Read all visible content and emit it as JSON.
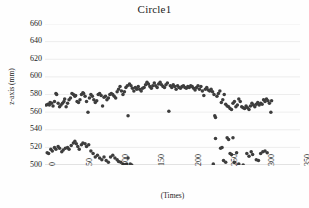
{
  "chart_data": {
    "type": "scatter",
    "title": "Circle1",
    "xlabel": "(Times)",
    "ylabel": "z-axis (mm)",
    "xlim": [
      0,
      350
    ],
    "ylim": [
      500,
      660
    ],
    "xticks": [
      "0",
      "50",
      "100",
      "150",
      "200",
      "250",
      "300",
      "350"
    ],
    "xtick_values": [
      0,
      50,
      100,
      150,
      200,
      250,
      300,
      350
    ],
    "yticks": [
      "500",
      "520",
      "540",
      "560",
      "580",
      "600",
      "620",
      "640",
      "660"
    ],
    "ytick_values": [
      500,
      520,
      540,
      560,
      580,
      600,
      620,
      640,
      660
    ],
    "grid": "horizontal",
    "legend": "none",
    "marker_color": "#3d3d3d",
    "marker_size": 2.6,
    "series": [
      {
        "name": "upper-band",
        "points": [
          [
            2,
            568
          ],
          [
            4,
            569
          ],
          [
            6,
            568
          ],
          [
            7,
            571
          ],
          [
            9,
            570
          ],
          [
            11,
            567
          ],
          [
            13,
            572
          ],
          [
            15,
            581
          ],
          [
            16,
            580
          ],
          [
            18,
            570
          ],
          [
            20,
            566
          ],
          [
            22,
            568
          ],
          [
            24,
            570
          ],
          [
            26,
            572
          ],
          [
            27,
            575
          ],
          [
            29,
            566
          ],
          [
            31,
            570
          ],
          [
            33,
            574
          ],
          [
            35,
            576
          ],
          [
            37,
            581
          ],
          [
            39,
            580
          ],
          [
            41,
            578
          ],
          [
            42,
            579
          ],
          [
            44,
            572
          ],
          [
            46,
            571
          ],
          [
            48,
            574
          ],
          [
            50,
            580
          ],
          [
            52,
            582
          ],
          [
            53,
            581
          ],
          [
            55,
            578
          ],
          [
            57,
            572
          ],
          [
            59,
            560
          ],
          [
            61,
            576
          ],
          [
            63,
            580
          ],
          [
            65,
            578
          ],
          [
            67,
            574
          ],
          [
            69,
            571
          ],
          [
            71,
            573
          ],
          [
            73,
            580
          ],
          [
            75,
            581
          ],
          [
            77,
            579
          ],
          [
            79,
            567
          ],
          [
            81,
            577
          ],
          [
            83,
            578
          ],
          [
            85,
            574
          ],
          [
            87,
            576
          ],
          [
            89,
            580
          ],
          [
            91,
            581
          ],
          [
            93,
            580
          ],
          [
            95,
            578
          ],
          [
            97,
            576
          ],
          [
            99,
            583
          ],
          [
            101,
            586
          ],
          [
            103,
            589
          ],
          [
            105,
            584
          ],
          [
            107,
            580
          ],
          [
            109,
            583
          ],
          [
            111,
            588
          ],
          [
            113,
            590
          ],
          [
            114,
            556
          ],
          [
            116,
            592
          ],
          [
            118,
            590
          ],
          [
            120,
            587
          ],
          [
            122,
            584
          ],
          [
            124,
            588
          ],
          [
            126,
            586
          ],
          [
            128,
            589
          ],
          [
            130,
            586
          ],
          [
            132,
            584
          ],
          [
            134,
            587
          ],
          [
            136,
            588
          ],
          [
            138,
            591
          ],
          [
            140,
            594
          ],
          [
            142,
            592
          ],
          [
            144,
            589
          ],
          [
            146,
            587
          ],
          [
            148,
            590
          ],
          [
            150,
            593
          ],
          [
            152,
            590
          ],
          [
            154,
            588
          ],
          [
            156,
            592
          ],
          [
            158,
            594
          ],
          [
            160,
            591
          ],
          [
            162,
            589
          ],
          [
            164,
            588
          ],
          [
            166,
            591
          ],
          [
            168,
            593
          ],
          [
            170,
            561
          ],
          [
            172,
            590
          ],
          [
            174,
            588
          ],
          [
            176,
            591
          ],
          [
            178,
            589
          ],
          [
            180,
            586
          ],
          [
            182,
            590
          ],
          [
            184,
            588
          ],
          [
            186,
            587
          ],
          [
            188,
            589
          ],
          [
            190,
            590
          ],
          [
            192,
            588
          ],
          [
            194,
            587
          ],
          [
            196,
            589
          ],
          [
            198,
            588
          ],
          [
            200,
            590
          ],
          [
            202,
            589
          ],
          [
            204,
            587
          ],
          [
            206,
            585
          ],
          [
            208,
            588
          ],
          [
            210,
            590
          ],
          [
            212,
            586
          ],
          [
            214,
            589
          ],
          [
            216,
            584
          ],
          [
            218,
            579
          ],
          [
            220,
            586
          ],
          [
            222,
            588
          ],
          [
            224,
            585
          ],
          [
            226,
            584
          ],
          [
            228,
            586
          ],
          [
            230,
            583
          ],
          [
            232,
            580
          ],
          [
            233,
            556
          ],
          [
            234,
            554
          ],
          [
            236,
            578
          ],
          [
            238,
            581
          ],
          [
            240,
            584
          ],
          [
            242,
            571
          ],
          [
            244,
            574
          ],
          [
            246,
            580
          ],
          [
            248,
            569
          ],
          [
            250,
            567
          ],
          [
            252,
            566
          ],
          [
            254,
            564
          ],
          [
            256,
            563
          ],
          [
            258,
            570
          ],
          [
            260,
            572
          ],
          [
            262,
            566
          ],
          [
            264,
            568
          ],
          [
            266,
            575
          ],
          [
            268,
            572
          ],
          [
            270,
            566
          ],
          [
            272,
            565
          ],
          [
            274,
            564
          ],
          [
            276,
            567
          ],
          [
            278,
            565
          ],
          [
            280,
            563
          ],
          [
            282,
            567
          ],
          [
            284,
            570
          ],
          [
            286,
            568
          ],
          [
            288,
            566
          ],
          [
            290,
            569
          ],
          [
            292,
            571
          ],
          [
            294,
            568
          ],
          [
            296,
            570
          ],
          [
            298,
            569
          ],
          [
            300,
            574
          ],
          [
            302,
            572
          ],
          [
            304,
            575
          ],
          [
            306,
            573
          ],
          [
            308,
            570
          ],
          [
            310,
            560
          ],
          [
            311,
            573
          ]
        ]
      },
      {
        "name": "lower-band",
        "points": [
          [
            3,
            514
          ],
          [
            5,
            513
          ],
          [
            8,
            518
          ],
          [
            10,
            516
          ],
          [
            13,
            520
          ],
          [
            15,
            518
          ],
          [
            18,
            521
          ],
          [
            20,
            519
          ],
          [
            23,
            515
          ],
          [
            25,
            517
          ],
          [
            28,
            519
          ],
          [
            31,
            520
          ],
          [
            33,
            518
          ],
          [
            36,
            522
          ],
          [
            39,
            525
          ],
          [
            41,
            527
          ],
          [
            43,
            524
          ],
          [
            45,
            521
          ],
          [
            47,
            518
          ],
          [
            50,
            523
          ],
          [
            52,
            525
          ],
          [
            55,
            524
          ],
          [
            57,
            521
          ],
          [
            60,
            523
          ],
          [
            63,
            516
          ],
          [
            66,
            513
          ],
          [
            69,
            509
          ],
          [
            72,
            511
          ],
          [
            75,
            508
          ],
          [
            78,
            506
          ],
          [
            81,
            509
          ],
          [
            84,
            505
          ],
          [
            87,
            503
          ],
          [
            90,
            509
          ],
          [
            93,
            511
          ],
          [
            96,
            508
          ],
          [
            99,
            506
          ],
          [
            101,
            504
          ],
          [
            104,
            503
          ],
          [
            107,
            501
          ],
          [
            109,
            500
          ],
          [
            112,
            501
          ],
          [
            114,
            508
          ],
          [
            117,
            501
          ],
          [
            119,
            500
          ],
          [
            231,
            501
          ],
          [
            234,
            530
          ],
          [
            241,
            519
          ],
          [
            243,
            520
          ],
          [
            245,
            505
          ],
          [
            248,
            503
          ],
          [
            250,
            531
          ],
          [
            252,
            529
          ],
          [
            254,
            513
          ],
          [
            256,
            512
          ],
          [
            258,
            531
          ],
          [
            260,
            503
          ],
          [
            263,
            514
          ],
          [
            266,
            501
          ],
          [
            272,
            500
          ],
          [
            277,
            513
          ],
          [
            280,
            510
          ],
          [
            283,
            515
          ],
          [
            285,
            512
          ],
          [
            290,
            506
          ],
          [
            293,
            505
          ],
          [
            296,
            513
          ],
          [
            299,
            515
          ],
          [
            302,
            516
          ],
          [
            305,
            514
          ]
        ]
      }
    ]
  }
}
